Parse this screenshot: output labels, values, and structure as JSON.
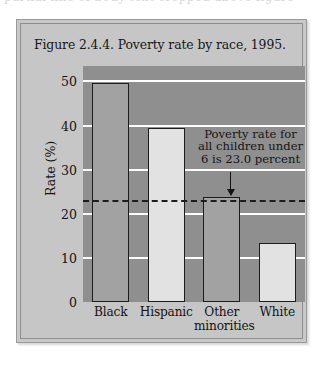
{
  "scan": {
    "top_cut_text": "partial line of body text cropped above figure"
  },
  "figure": {
    "title": "Figure 2.4.4. Poverty rate by race, 1995."
  },
  "chart_data": {
    "type": "bar",
    "title": "Figure 2.4.4. Poverty rate by race, 1995.",
    "xlabel": "",
    "ylabel": "Rate (%)",
    "categories": [
      "Black",
      "Hispanic",
      "Other minorities",
      "White"
    ],
    "category_lines": [
      [
        "Black"
      ],
      [
        "Hispanic"
      ],
      [
        "Other",
        "minorities"
      ],
      [
        "White"
      ]
    ],
    "values": [
      49.6,
      39.5,
      23.7,
      13.3
    ],
    "bar_shades": [
      "dark",
      "light",
      "dark",
      "light"
    ],
    "ylim": [
      0,
      53.5
    ],
    "yticks": [
      0,
      10,
      20,
      30,
      40,
      50
    ],
    "ytick_labels": [
      "0",
      "10",
      "20",
      "30",
      "40",
      "50"
    ],
    "grid": true,
    "grid_color": "#ffffff",
    "plot_bg": "#8f8f8f",
    "figure_bg": "#c6c6c6",
    "reference_line": {
      "value": 23.0,
      "style": "dashed",
      "color": "#1d1d1d",
      "label": "Poverty rate for all children under 6 is 23.0 percent",
      "label_lines": [
        "Poverty rate for",
        "all children under",
        "6 is 23.0 percent"
      ]
    },
    "legend": null
  }
}
